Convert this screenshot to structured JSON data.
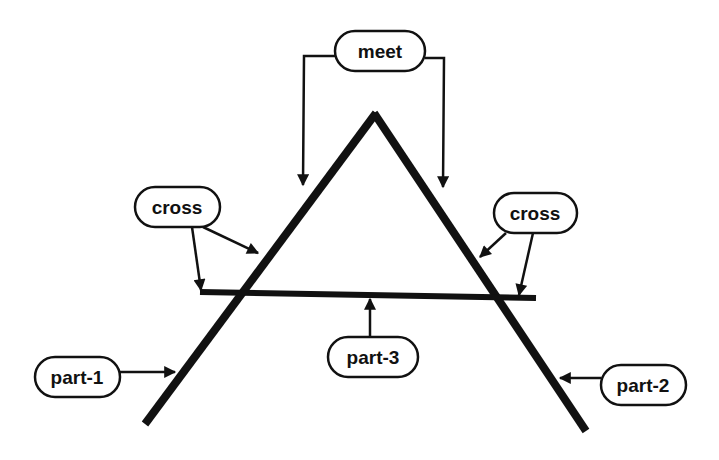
{
  "diagram": {
    "colors": {
      "stroke": "#111111",
      "background": "#ffffff"
    },
    "labels": {
      "meet": "meet",
      "cross_left": "cross",
      "cross_right": "cross",
      "part1": "part-1",
      "part2": "part-2",
      "part3": "part-3"
    },
    "parts": [
      {
        "id": "part-1",
        "role": "left slanted line"
      },
      {
        "id": "part-2",
        "role": "right slanted line"
      },
      {
        "id": "part-3",
        "role": "horizontal crossbar"
      }
    ],
    "relations": [
      {
        "label": "meet",
        "between": [
          "part-1",
          "part-2"
        ]
      },
      {
        "label": "cross",
        "between": [
          "part-1",
          "part-3"
        ]
      },
      {
        "label": "cross",
        "between": [
          "part-2",
          "part-3"
        ]
      }
    ]
  }
}
